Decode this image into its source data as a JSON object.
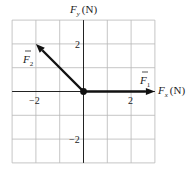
{
  "diagram": {
    "x_axis_label_var": "F",
    "x_axis_label_sub": "x",
    "x_axis_label_unit": "(N)",
    "y_axis_label_var": "F",
    "y_axis_label_sub": "y",
    "y_axis_label_unit": "(N)",
    "x_range": [
      -3,
      3
    ],
    "y_range": [
      -3,
      3
    ],
    "grid_step": 1,
    "tick_labels": {
      "x_neg": "−2",
      "x_pos": "2",
      "y_pos": "2",
      "y_neg": "−2"
    },
    "vectors": [
      {
        "name": "F",
        "sub": "1",
        "from": [
          0,
          0
        ],
        "to": [
          3,
          0
        ]
      },
      {
        "name": "F",
        "sub": "2",
        "from": [
          0,
          0
        ],
        "to": [
          -2,
          2
        ]
      }
    ],
    "colors": {
      "grid": "#b8b8b8",
      "axis": "#222222",
      "vector": "#111111"
    }
  }
}
